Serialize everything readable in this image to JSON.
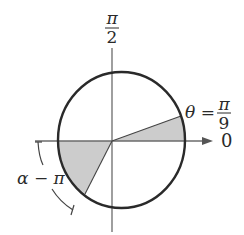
{
  "diagram": {
    "type": "polar-sector",
    "labels": {
      "top_num": "π",
      "top_den": "2",
      "right_axis": "0",
      "theta_lhs": "θ =",
      "theta_num": "π",
      "theta_den": "9",
      "alpha": "α − π"
    },
    "colors": {
      "stroke": "#2a2a2a",
      "axis": "#6b6b6b",
      "fill": "#cccccc",
      "background": "#ffffff"
    }
  }
}
